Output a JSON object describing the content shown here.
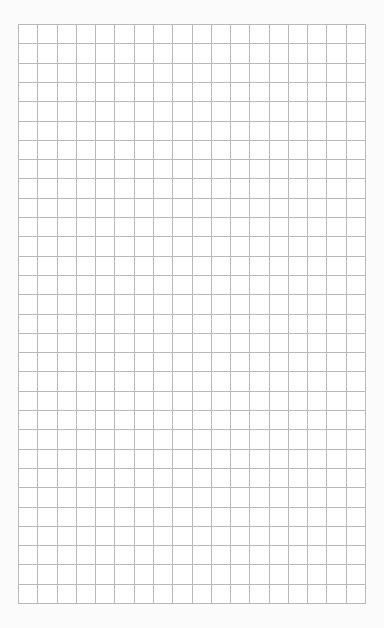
{
  "page": {
    "type": "graph-paper",
    "background_color": "#fbfbfb",
    "paper_color": "#ffffff"
  },
  "grid": {
    "columns": 18,
    "rows": 30,
    "cell_width": 19.28,
    "cell_height": 19.3,
    "line_color": "#b9b9b9",
    "left": 18,
    "top": 24,
    "width": 347,
    "height": 579
  }
}
